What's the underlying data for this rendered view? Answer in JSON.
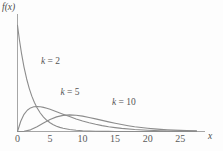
{
  "chart_data": {
    "type": "line",
    "title": "",
    "subtitle": "",
    "xlabel": "x",
    "ylabel": "f(x)",
    "xlim": [
      0,
      28.5
    ],
    "ylim": [
      0,
      0.52
    ],
    "grid": false,
    "legend_position": "inline-annotations",
    "xticks": [
      0,
      5,
      10,
      15,
      20,
      25
    ],
    "xtick_labels": [
      "0",
      "5",
      "10",
      "15",
      "20",
      "25"
    ],
    "yticks": [],
    "ytick_labels": [],
    "annotations": [
      {
        "text": "k = 2",
        "k_symbol": "k",
        "equals": " = ",
        "value": "2",
        "x": 3.6,
        "y": 0.325
      },
      {
        "text": "k = 5",
        "k_symbol": "k",
        "equals": " = ",
        "value": "5",
        "x": 6.6,
        "y": 0.182
      },
      {
        "text": "k = 10",
        "k_symbol": "k",
        "equals": " = ",
        "value": "10",
        "x": 14.5,
        "y": 0.133
      }
    ],
    "series": [
      {
        "name": "k = 2",
        "k": 2,
        "color": "#8c8c8c",
        "x": [
          0.0,
          0.3,
          0.6,
          1.0,
          1.4,
          1.8,
          2.2,
          2.6,
          3.0,
          3.5,
          4.0,
          4.5,
          5.0,
          5.5,
          6.0,
          6.5,
          7.0,
          8.0,
          9.0,
          10.0,
          11.0,
          12.0,
          13.0,
          14.0,
          15.0,
          16.0,
          18.0,
          20.0,
          22.0,
          24.0,
          26.0,
          27.5
        ],
        "y": [
          0.5,
          0.4304,
          0.3704,
          0.3033,
          0.2483,
          0.2033,
          0.1664,
          0.1363,
          0.1116,
          0.0869,
          0.0677,
          0.0527,
          0.041,
          0.032,
          0.0249,
          0.0194,
          0.0151,
          0.0092,
          0.0056,
          0.0034,
          0.002,
          0.0012,
          0.0008,
          0.0005,
          0.0003,
          0.0002,
          0.0001,
          0.0,
          0.0,
          0.0,
          0.0,
          0.0
        ]
      },
      {
        "name": "k = 5",
        "k": 5,
        "color": "#8c8c8c",
        "x": [
          0.0,
          0.5,
          1.0,
          1.5,
          2.0,
          2.5,
          3.0,
          3.5,
          4.0,
          4.5,
          5.0,
          5.5,
          6.0,
          7.0,
          8.0,
          9.0,
          10.0,
          11.0,
          12.0,
          13.0,
          14.0,
          15.0,
          16.0,
          18.0,
          20.0,
          22.0,
          24.0,
          26.0,
          27.5
        ],
        "y": [
          0.0,
          0.0484,
          0.0807,
          0.1001,
          0.111,
          0.1162,
          0.1176,
          0.1163,
          0.1134,
          0.1093,
          0.1044,
          0.099,
          0.0934,
          0.0817,
          0.0701,
          0.0593,
          0.0496,
          0.0411,
          0.0338,
          0.0276,
          0.0224,
          0.0181,
          0.0145,
          0.0092,
          0.0058,
          0.0036,
          0.0022,
          0.0013,
          0.0009
        ]
      },
      {
        "name": "k = 10",
        "k": 10,
        "color": "#8c8c8c",
        "x": [
          0.0,
          1.0,
          2.0,
          3.0,
          4.0,
          5.0,
          6.0,
          7.0,
          8.0,
          9.0,
          10.0,
          11.0,
          12.0,
          13.0,
          14.0,
          15.0,
          16.0,
          17.0,
          18.0,
          19.0,
          20.0,
          21.0,
          22.0,
          23.0,
          24.0,
          25.0,
          26.0,
          27.5
        ],
        "y": [
          0.0,
          0.0008,
          0.0077,
          0.0221,
          0.0402,
          0.0567,
          0.0688,
          0.0757,
          0.078,
          0.0765,
          0.0722,
          0.0662,
          0.0594,
          0.0522,
          0.0452,
          0.0386,
          0.0326,
          0.0273,
          0.0226,
          0.0186,
          0.0152,
          0.0124,
          0.01,
          0.008,
          0.0064,
          0.0051,
          0.004,
          0.0028
        ]
      }
    ],
    "colors": {
      "axis": "#9a9a9a",
      "curve": "#8c8c8c",
      "text": "#555555",
      "background": "#fdfdfd"
    }
  }
}
